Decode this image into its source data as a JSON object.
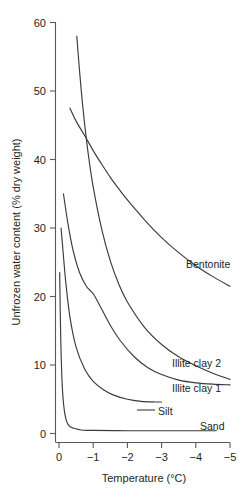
{
  "chart_data": {
    "type": "line",
    "title": "",
    "xlabel": "Temperature (°C)",
    "ylabel": "Unfrozen water content (% dry weight)",
    "xlim": [
      0,
      -5
    ],
    "ylim": [
      0,
      60
    ],
    "x_ticks": [
      "0",
      "−1",
      "−2",
      "−3",
      "−4",
      "−5"
    ],
    "x_tick_values": [
      0,
      -1,
      -2,
      -3,
      -4,
      -5
    ],
    "y_ticks": [
      "0",
      "10",
      "20",
      "30",
      "40",
      "50",
      "60"
    ],
    "y_tick_values": [
      0,
      10,
      20,
      30,
      40,
      50,
      60
    ],
    "grid": false,
    "legend_position": "inline-curve-labels",
    "series": [
      {
        "name": "Bentonite",
        "label": "Bentonite",
        "x": [
          -0.32,
          -0.5,
          -0.75,
          -1.0,
          -1.25,
          -1.5,
          -1.75,
          -2.0,
          -2.5,
          -3.0,
          -3.5,
          -4.0,
          -4.5,
          -5.0
        ],
        "values": [
          47.5,
          45.6,
          43.5,
          41.3,
          39.3,
          37.4,
          35.7,
          34.1,
          31.2,
          28.6,
          26.4,
          24.5,
          22.9,
          21.5
        ]
      },
      {
        "name": "Illite clay 2",
        "label": "Illite clay 2",
        "x": [
          -0.52,
          -0.6,
          -0.7,
          -0.85,
          -1.0,
          -1.25,
          -1.5,
          -1.75,
          -2.0,
          -2.5,
          -3.0,
          -3.5,
          -4.0,
          -4.5,
          -5.0
        ],
        "values": [
          58.0,
          53.0,
          47.5,
          41.0,
          36.0,
          29.8,
          25.2,
          21.8,
          19.2,
          15.5,
          13.0,
          11.2,
          9.9,
          8.8,
          7.9
        ]
      },
      {
        "name": "Illite clay 1",
        "label": "Illite clay 1",
        "x": [
          -0.13,
          -0.25,
          -0.4,
          -0.6,
          -0.8,
          -1.0,
          -1.2,
          -1.5,
          -1.8,
          -2.2,
          -2.6,
          -3.0,
          -3.5,
          -4.0,
          -4.5,
          -5.0
        ],
        "values": [
          35.0,
          31.0,
          27.0,
          23.5,
          21.5,
          20.4,
          18.6,
          15.8,
          13.5,
          11.2,
          9.6,
          8.6,
          7.8,
          7.4,
          7.2,
          7.1
        ]
      },
      {
        "name": "Silt",
        "label": "Silt",
        "x": [
          -0.06,
          -0.12,
          -0.2,
          -0.32,
          -0.5,
          -0.75,
          -1.0,
          -1.3,
          -1.6,
          -2.0,
          -2.4,
          -2.8,
          -3.0
        ],
        "values": [
          30.0,
          26.5,
          22.0,
          17.0,
          12.6,
          9.4,
          7.6,
          6.4,
          5.6,
          5.0,
          4.7,
          4.6,
          4.6
        ]
      },
      {
        "name": "Sand",
        "label": "Sand",
        "x": [
          -0.02,
          -0.05,
          -0.1,
          -0.18,
          -0.3,
          -0.6,
          -1.0,
          -2.0,
          -3.0,
          -4.0,
          -4.6
        ],
        "values": [
          23.5,
          14.0,
          6.5,
          2.6,
          1.1,
          0.55,
          0.45,
          0.4,
          0.4,
          0.4,
          0.4
        ]
      }
    ],
    "series_label_positions": [
      {
        "name": "Bentonite",
        "x": 186,
        "y": 268
      },
      {
        "name": "Illite clay 2",
        "x": 172,
        "y": 367
      },
      {
        "name": "Illite clay 1",
        "x": 172,
        "y": 392
      },
      {
        "name": "Silt",
        "x": 158,
        "y": 415
      },
      {
        "name": "Sand",
        "x": 200,
        "y": 430
      }
    ],
    "colors": {
      "curve": "#3b3b3d",
      "axis": "#58585b",
      "text": "#231f20",
      "background": "#ffffff"
    }
  }
}
